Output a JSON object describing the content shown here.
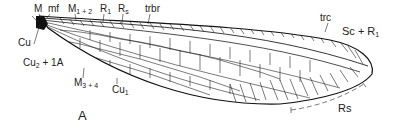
{
  "figure": {
    "panel_label": "A",
    "labels": {
      "M": "M",
      "mf": "mf",
      "M12": {
        "base": "M",
        "sub": "1 + 2"
      },
      "R1": {
        "base": "R",
        "sub": "1"
      },
      "Rs_top": {
        "base": "R",
        "sub": "s"
      },
      "trbr": "trbr",
      "trc": "trc",
      "ScR1": {
        "base": "Sc + R",
        "sub": "1"
      },
      "Cu": "Cu",
      "Cu2_1A": {
        "base": "Cu",
        "sub": "2",
        "tail": " + 1A"
      },
      "M34": {
        "base": "M",
        "sub": "3 + 4"
      },
      "Cu1": {
        "base": "Cu",
        "sub": "1"
      },
      "Rs_bottom": "Rs"
    }
  }
}
